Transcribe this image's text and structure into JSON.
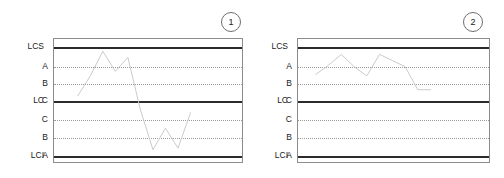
{
  "chart_data": [
    {
      "type": "line",
      "title": "",
      "panel_label": "1",
      "xlabel": "",
      "ylabel": "",
      "grid": true,
      "legend_position": "none",
      "ylim": [
        0,
        8
      ],
      "zone_lines": [
        {
          "id": "LCS",
          "outer_label": "LCS",
          "inner_label": "",
          "value": 7,
          "style": "solid"
        },
        {
          "id": "A_upper",
          "outer_label": "",
          "inner_label": "A",
          "value": 6,
          "style": "dotted"
        },
        {
          "id": "B_upper",
          "outer_label": "",
          "inner_label": "B",
          "value": 5,
          "style": "dotted"
        },
        {
          "id": "LC",
          "outer_label": "LC",
          "inner_label": "C",
          "value": 4,
          "style": "solid"
        },
        {
          "id": "C_lower",
          "outer_label": "",
          "inner_label": "C",
          "value": 3,
          "style": "dotted"
        },
        {
          "id": "B_lower",
          "outer_label": "",
          "inner_label": "B",
          "value": 2,
          "style": "dotted"
        },
        {
          "id": "LCI",
          "outer_label": "LCI",
          "inner_label": "A",
          "value": 1,
          "style": "solid"
        }
      ],
      "x": [
        0,
        1,
        2,
        3,
        4,
        5,
        6,
        7,
        8,
        9
      ],
      "values": [
        4.3,
        5.6,
        7.2,
        5.9,
        6.8,
        3.4,
        0.8,
        2.2,
        0.9,
        3.2
      ]
    },
    {
      "type": "line",
      "title": "",
      "panel_label": "2",
      "xlabel": "",
      "ylabel": "",
      "grid": true,
      "legend_position": "none",
      "ylim": [
        0,
        8
      ],
      "zone_lines": [
        {
          "id": "LCS",
          "outer_label": "LCS",
          "inner_label": "",
          "value": 7,
          "style": "solid"
        },
        {
          "id": "A_upper",
          "outer_label": "",
          "inner_label": "A",
          "value": 6,
          "style": "dotted"
        },
        {
          "id": "B_upper",
          "outer_label": "",
          "inner_label": "B",
          "value": 5,
          "style": "dotted"
        },
        {
          "id": "LC",
          "outer_label": "LC",
          "inner_label": "C",
          "value": 4,
          "style": "solid"
        },
        {
          "id": "C_lower",
          "outer_label": "",
          "inner_label": "C",
          "value": 3,
          "style": "dotted"
        },
        {
          "id": "B_lower",
          "outer_label": "",
          "inner_label": "B",
          "value": 2,
          "style": "dotted"
        },
        {
          "id": "LCI",
          "outer_label": "LCI",
          "inner_label": "A",
          "value": 1,
          "style": "solid"
        }
      ],
      "x": [
        0,
        1,
        2,
        3,
        4,
        5,
        6,
        7,
        8,
        9
      ],
      "values": [
        5.7,
        6.3,
        7.0,
        6.2,
        5.6,
        7.0,
        6.6,
        6.2,
        4.7,
        4.7
      ]
    }
  ],
  "colors": {
    "limit_line": "#2b2b2b",
    "zone_line": "#9a9a9a",
    "series_line": "#c9c9c9",
    "box_border": "#8c8c8c",
    "badge_border": "#6e6e6e",
    "text": "#1a1a1a",
    "background": "#ffffff"
  }
}
